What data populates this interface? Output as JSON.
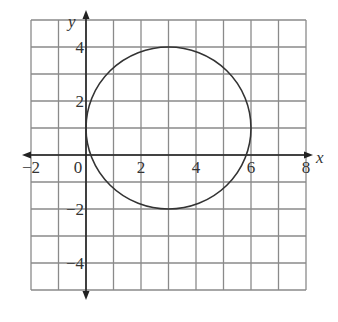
{
  "diagram": {
    "type": "coordinate-plane-with-circle",
    "axes": {
      "x_label": "x",
      "y_label": "y",
      "x_range": [
        -2,
        8
      ],
      "y_range": [
        -5,
        5
      ],
      "grid_step": 1,
      "x_tick_labels": [
        {
          "value": -2,
          "text": "−2"
        },
        {
          "value": 0,
          "text": "0"
        },
        {
          "value": 2,
          "text": "2"
        },
        {
          "value": 4,
          "text": "4"
        },
        {
          "value": 6,
          "text": "6"
        },
        {
          "value": 8,
          "text": "8"
        }
      ],
      "y_tick_labels": [
        {
          "value": 4,
          "text": "4"
        },
        {
          "value": 2,
          "text": "2"
        },
        {
          "value": -2,
          "text": "−2"
        },
        {
          "value": -4,
          "text": "−4"
        }
      ]
    },
    "circle": {
      "center": [
        3,
        1
      ],
      "radius": 3,
      "stroke": "#333333"
    },
    "colors": {
      "grid": "#8a8a8a",
      "axis": "#222222",
      "curve": "#333333",
      "text": "#333333"
    }
  }
}
